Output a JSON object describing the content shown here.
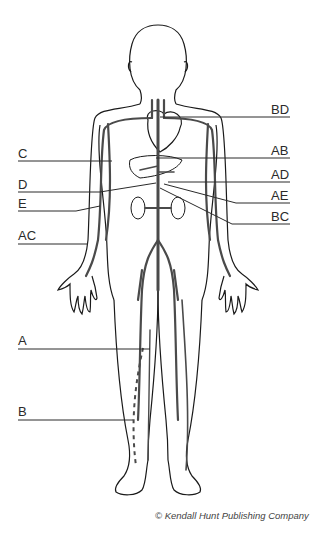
{
  "diagram": {
    "labels_left": [
      {
        "id": "C",
        "text": "C",
        "x": 18,
        "y": 147,
        "line_y": 161
      },
      {
        "id": "D",
        "text": "D",
        "x": 18,
        "y": 178,
        "line_y": 192
      },
      {
        "id": "E",
        "text": "E",
        "x": 18,
        "y": 197,
        "line_y": 211
      },
      {
        "id": "AC",
        "text": "AC",
        "x": 18,
        "y": 229,
        "line_y": 244
      },
      {
        "id": "A",
        "text": "A",
        "x": 18,
        "y": 333,
        "line_y": 349
      },
      {
        "id": "B",
        "text": "B",
        "x": 18,
        "y": 404,
        "line_y": 420
      }
    ],
    "labels_right": [
      {
        "id": "BD",
        "text": "BD",
        "x": 271,
        "y": 104,
        "line_y": 117
      },
      {
        "id": "AB",
        "text": "AB",
        "x": 271,
        "y": 144,
        "line_y": 158
      },
      {
        "id": "AD",
        "text": "AD",
        "x": 271,
        "y": 167,
        "line_y": 182
      },
      {
        "id": "AE",
        "text": "AE",
        "x": 271,
        "y": 188,
        "line_y": 203
      },
      {
        "id": "BC",
        "text": "BC",
        "x": 271,
        "y": 208,
        "line_y": 224
      }
    ],
    "credit": "© Kendall Hunt Publishing Company",
    "colors": {
      "outline": "#1a1a1a",
      "vessel": "#4a4a4a",
      "leader": "#2a2a2a"
    }
  }
}
